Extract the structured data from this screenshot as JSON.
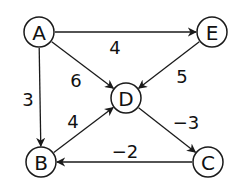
{
  "diagram": {
    "type": "directed-weighted-graph",
    "nodes": [
      {
        "id": "A",
        "label": "A",
        "x": 39,
        "y": 32
      },
      {
        "id": "E",
        "label": "E",
        "x": 212,
        "y": 32
      },
      {
        "id": "D",
        "label": "D",
        "x": 126,
        "y": 98
      },
      {
        "id": "B",
        "label": "B",
        "x": 41,
        "y": 162
      },
      {
        "id": "C",
        "label": "C",
        "x": 208,
        "y": 162
      }
    ],
    "edges": [
      {
        "from": "A",
        "to": "E",
        "weight": "4",
        "label_x": 115,
        "label_y": 47
      },
      {
        "from": "A",
        "to": "D",
        "weight": "6",
        "label_x": 76,
        "label_y": 80
      },
      {
        "from": "A",
        "to": "B",
        "weight": "3",
        "label_x": 28,
        "label_y": 99
      },
      {
        "from": "E",
        "to": "D",
        "weight": "5",
        "label_x": 182,
        "label_y": 76
      },
      {
        "from": "B",
        "to": "D",
        "weight": "4",
        "label_x": 73,
        "label_y": 121
      },
      {
        "from": "D",
        "to": "C",
        "weight": "−3",
        "label_x": 186,
        "label_y": 122
      },
      {
        "from": "C",
        "to": "B",
        "weight": "−2",
        "label_x": 125,
        "label_y": 151
      }
    ],
    "colors": {
      "stroke": "#1a1a1a",
      "fill": "#ffffff",
      "text": "#111111"
    },
    "node_radius": 15
  }
}
